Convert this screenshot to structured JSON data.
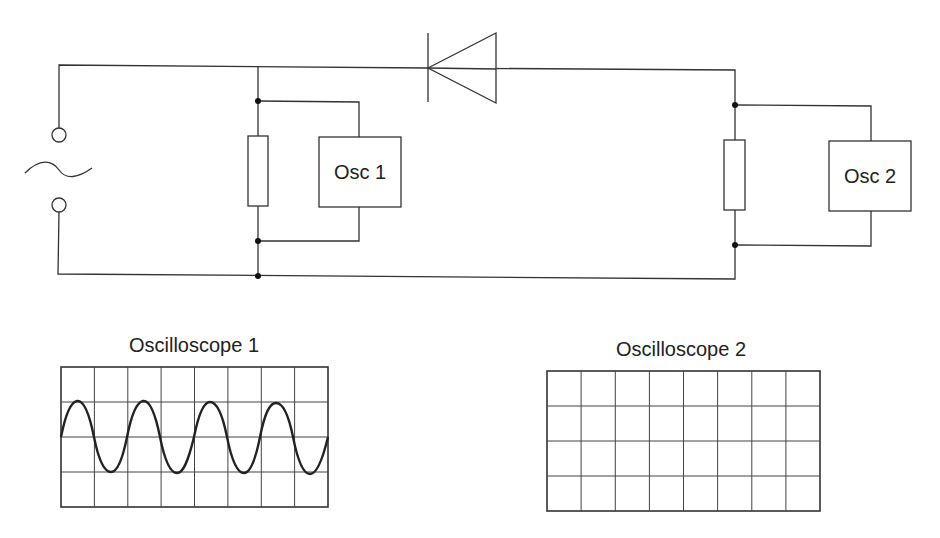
{
  "diagram": {
    "components": {
      "ac_source": {
        "symbol": "~"
      },
      "diode": {
        "orientation": "cathode-left"
      },
      "resistor_1": {},
      "resistor_2": {},
      "osc_1": {
        "label": "Osc 1"
      },
      "osc_2": {
        "label": "Osc 2"
      }
    },
    "screens": [
      {
        "title": "Oscilloscope 1",
        "grid_cols": 8,
        "grid_rows": 4,
        "trace": "sine wave, ~3.9 cycles, amplitude 1 division"
      },
      {
        "title": "Oscilloscope 2",
        "grid_cols": 8,
        "grid_rows": 4,
        "trace": "blank"
      }
    ]
  },
  "colors": {
    "line": "#333333",
    "background": "#ffffff"
  }
}
